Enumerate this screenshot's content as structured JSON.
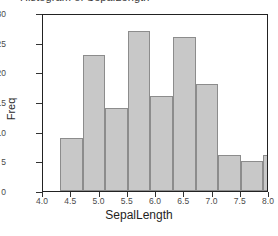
{
  "chart_data": {
    "type": "bar",
    "title": "Histogram of SepalLength",
    "xlabel": "SepalLength",
    "ylabel": "Freq",
    "categories": [
      "4.3",
      "4.7",
      "5.1",
      "5.5",
      "5.9",
      "6.3",
      "6.7",
      "7.1",
      "7.5",
      "7.9"
    ],
    "bin_edges": [
      4.3,
      4.7,
      5.1,
      5.5,
      5.9,
      6.3,
      6.7,
      7.1,
      7.5,
      7.9
    ],
    "values": [
      9,
      23,
      14,
      27,
      16,
      26,
      18,
      6,
      5,
      6
    ],
    "xlim": [
      4.0,
      8.0
    ],
    "ylim": [
      0,
      30
    ],
    "xticks": [
      "4.0",
      "4.5",
      "5.0",
      "5.5",
      "6.0",
      "6.5",
      "7.0",
      "7.5",
      "8.0"
    ],
    "xtick_values": [
      4.0,
      4.5,
      5.0,
      5.5,
      6.0,
      6.5,
      7.0,
      7.5,
      8.0
    ],
    "yticks": [
      "0",
      "5",
      "10",
      "15",
      "20",
      "25",
      "30"
    ],
    "ytick_values": [
      0,
      5,
      10,
      15,
      20,
      25,
      30
    ],
    "grid": false,
    "legend": null,
    "bar_color": "#c8c8c8",
    "bar_edge_color": "#8c8c8c",
    "axis_color": "#222222",
    "background_color": "#ffffff"
  }
}
